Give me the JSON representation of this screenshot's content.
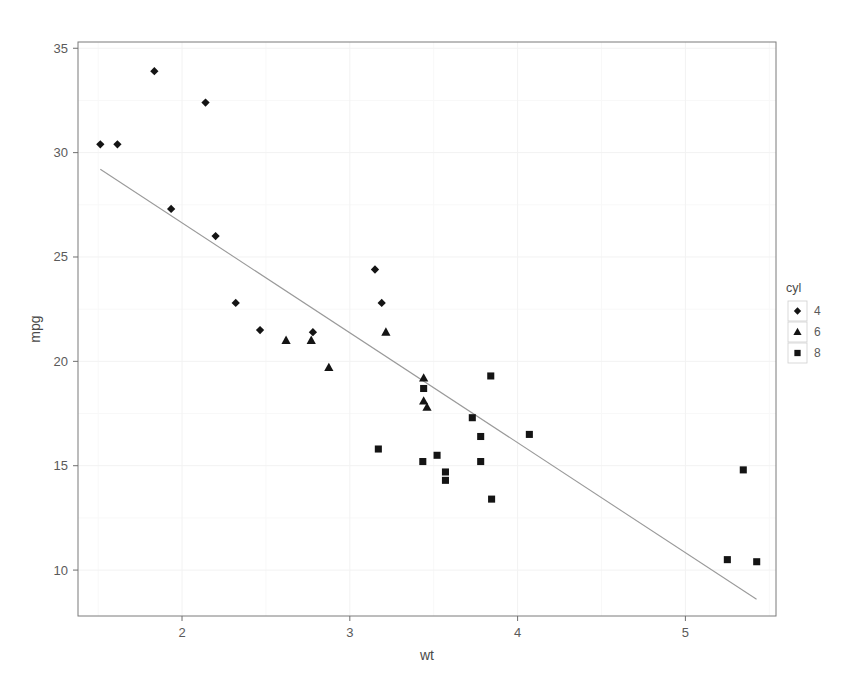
{
  "chart_data": {
    "type": "scatter",
    "title": "",
    "subtitle": "",
    "xlabel": "wt",
    "ylabel": "mpg",
    "xlim": [
      1.38,
      5.54
    ],
    "ylim": [
      7.8,
      35.3
    ],
    "xticks": [
      2,
      3,
      4,
      5
    ],
    "xtick_labels": [
      "2",
      "3",
      "4",
      "5"
    ],
    "yticks": [
      10,
      15,
      20,
      25,
      30,
      35
    ],
    "ytick_labels": [
      "10",
      "15",
      "20",
      "25",
      "30",
      "35"
    ],
    "grid": "faint",
    "legend": {
      "position": "right",
      "title": "cyl",
      "entries": [
        {
          "label": "4",
          "marker": "diamond"
        },
        {
          "label": "6",
          "marker": "triangle"
        },
        {
          "label": "8",
          "marker": "square"
        }
      ]
    },
    "marker_color": "#141414",
    "regression": {
      "type": "linear-fit",
      "color": "#9a9a9a",
      "x_start": 1.513,
      "y_start": 29.2,
      "x_end": 5.424,
      "y_end": 8.6
    },
    "series": [
      {
        "name": "4",
        "marker": "diamond",
        "points": [
          {
            "x": 1.513,
            "y": 30.4
          },
          {
            "x": 1.615,
            "y": 30.4
          },
          {
            "x": 1.835,
            "y": 33.9
          },
          {
            "x": 1.935,
            "y": 27.3
          },
          {
            "x": 2.14,
            "y": 32.4
          },
          {
            "x": 2.2,
            "y": 26.0
          },
          {
            "x": 2.32,
            "y": 22.8
          },
          {
            "x": 2.465,
            "y": 21.5
          },
          {
            "x": 2.78,
            "y": 21.4
          },
          {
            "x": 3.15,
            "y": 24.4
          },
          {
            "x": 3.19,
            "y": 22.8
          }
        ]
      },
      {
        "name": "6",
        "marker": "triangle",
        "points": [
          {
            "x": 2.62,
            "y": 21.0
          },
          {
            "x": 2.77,
            "y": 21.0
          },
          {
            "x": 2.875,
            "y": 19.7
          },
          {
            "x": 3.215,
            "y": 21.4
          },
          {
            "x": 3.44,
            "y": 19.2
          },
          {
            "x": 3.44,
            "y": 18.1
          },
          {
            "x": 3.46,
            "y": 17.8
          }
        ]
      },
      {
        "name": "8",
        "marker": "square",
        "points": [
          {
            "x": 3.17,
            "y": 15.8
          },
          {
            "x": 3.435,
            "y": 15.2
          },
          {
            "x": 3.52,
            "y": 15.5
          },
          {
            "x": 3.44,
            "y": 18.7
          },
          {
            "x": 3.57,
            "y": 14.3
          },
          {
            "x": 3.57,
            "y": 14.7
          },
          {
            "x": 3.73,
            "y": 17.3
          },
          {
            "x": 3.78,
            "y": 16.4
          },
          {
            "x": 3.78,
            "y": 15.2
          },
          {
            "x": 3.84,
            "y": 19.3
          },
          {
            "x": 3.845,
            "y": 13.4
          },
          {
            "x": 4.07,
            "y": 16.5
          },
          {
            "x": 5.25,
            "y": 10.5
          },
          {
            "x": 5.345,
            "y": 14.8
          },
          {
            "x": 5.425,
            "y": 10.4
          }
        ]
      }
    ]
  }
}
